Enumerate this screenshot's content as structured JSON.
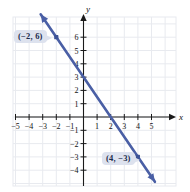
{
  "chart_data": {
    "type": "line",
    "title": "",
    "xlabel": "x",
    "ylabel": "y",
    "xlim": [
      -5.8,
      5.8
    ],
    "ylim": [
      -4.8,
      6.8
    ],
    "grid": true,
    "legend": "none",
    "x_ticks": [
      "-5",
      "-4",
      "-3",
      "-2",
      "-1",
      "1",
      "2",
      "3",
      "4",
      "5"
    ],
    "x_tick_values": [
      -5,
      -4,
      -3,
      -2,
      -1,
      1,
      2,
      3,
      4,
      5
    ],
    "y_ticks": [
      "6",
      "5",
      "4",
      "3",
      "2",
      "1",
      "-1",
      "-2",
      "-3",
      "-4"
    ],
    "y_tick_values": [
      6,
      5,
      4,
      3,
      2,
      1,
      -1,
      -2,
      -3,
      -4
    ],
    "series": [
      {
        "name": "line",
        "slope": -1.5,
        "intercept": 3,
        "color": "#4a5fa5",
        "arrows": "both",
        "points": [
          {
            "label": "(-2, 6)",
            "x": -2,
            "y": 6
          },
          {
            "label": "(4, -3)",
            "x": 4,
            "y": -3
          }
        ]
      }
    ]
  },
  "annotations": {
    "point_a_label": "(−2, 6)",
    "point_b_label": "(4, −3)"
  },
  "axes": {
    "x_name": "x",
    "y_name": "y"
  },
  "colors": {
    "line": "#4a5fa5",
    "grid": "#e8eaef",
    "axis": "#1a1a1a",
    "callout_bg": "#dde2ee",
    "callout_text": "#1b2a4a"
  }
}
